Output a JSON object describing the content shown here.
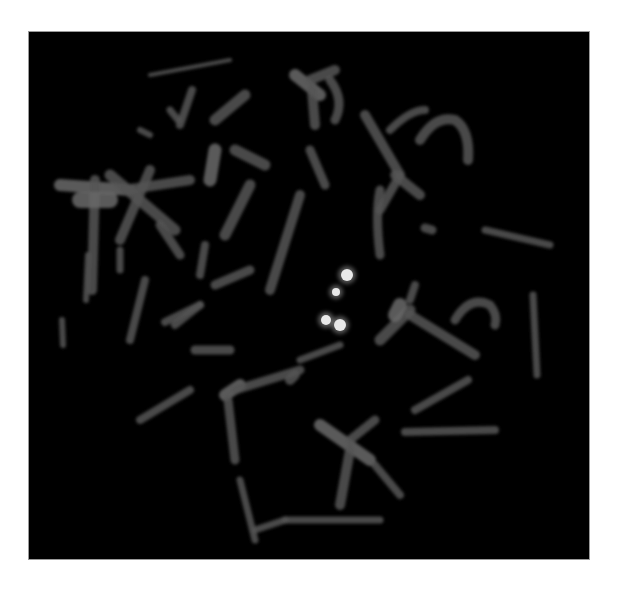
{
  "figure": {
    "kind": "fluorescence-micrograph",
    "background_color": "#000000",
    "page_color": "#ffffff",
    "panel": {
      "x": 29,
      "y": 32,
      "width": 560,
      "height": 527
    },
    "colors": {
      "chromosome": "#555555",
      "chromosome_bright": "#6a6a6a",
      "signal": "#e8e8e8",
      "signal_glow": "#bdbdbd"
    }
  },
  "chromosomes": [
    {
      "d": "M 60 185 L 130 190",
      "w": 12
    },
    {
      "d": "M 95 180 L 92 290",
      "w": 10
    },
    {
      "d": "M 80 200 L 110 200",
      "w": 16
    },
    {
      "d": "M 110 175 L 175 230",
      "w": 11
    },
    {
      "d": "M 150 170 L 120 240",
      "w": 10
    },
    {
      "d": "M 125 190 L 190 180",
      "w": 10
    },
    {
      "d": "M 160 225 L 180 255",
      "w": 9
    },
    {
      "d": "M 192 90 L 180 125",
      "w": 8
    },
    {
      "d": "M 245 95 L 215 120",
      "w": 11
    },
    {
      "d": "M 215 150 L 210 180",
      "w": 13
    },
    {
      "d": "M 235 150 L 265 165",
      "w": 11
    },
    {
      "d": "M 250 185 L 225 235",
      "w": 11
    },
    {
      "d": "M 300 195 L 270 290",
      "w": 10
    },
    {
      "d": "M 200 275 L 205 245",
      "w": 8
    },
    {
      "d": "M 250 270 L 215 285",
      "w": 9
    },
    {
      "d": "M 200 305 L 175 325",
      "w": 8
    },
    {
      "d": "M 145 280 L 130 340",
      "w": 8
    },
    {
      "d": "M 120 250 L 120 270",
      "w": 7
    },
    {
      "d": "M 88 255 L 86 300",
      "w": 6
    },
    {
      "d": "M 62 320 L 63 345",
      "w": 6
    },
    {
      "d": "M 195 350 L 230 350",
      "w": 9
    },
    {
      "d": "M 295 75 L 320 95",
      "w": 12
    },
    {
      "d": "M 310 80 L 335 70",
      "w": 10
    },
    {
      "d": "M 312 90 L 315 125",
      "w": 10
    },
    {
      "d": "M 330 80 Q 345 100 335 120",
      "w": 9
    },
    {
      "d": "M 310 150 L 325 185",
      "w": 9
    },
    {
      "d": "M 365 115 L 400 175",
      "w": 10
    },
    {
      "d": "M 395 175 L 420 195",
      "w": 10
    },
    {
      "d": "M 400 175 L 380 210",
      "w": 9
    },
    {
      "d": "M 390 130 Q 410 110 425 110",
      "w": 8
    },
    {
      "d": "M 380 190 Q 375 215 380 255",
      "w": 9
    },
    {
      "d": "M 420 140 Q 435 115 455 120 Q 470 130 468 160",
      "w": 10
    },
    {
      "d": "M 425 228 L 432 230",
      "w": 9
    },
    {
      "d": "M 485 230 L 550 245",
      "w": 7
    },
    {
      "d": "M 410 310 L 380 340",
      "w": 11
    },
    {
      "d": "M 400 305 L 395 315",
      "w": 14
    },
    {
      "d": "M 410 300 L 415 285",
      "w": 8
    },
    {
      "d": "M 410 315 L 475 355",
      "w": 10
    },
    {
      "d": "M 455 320 Q 470 295 490 305 Q 498 315 495 325",
      "w": 9
    },
    {
      "d": "M 533 295 L 537 375",
      "w": 7
    },
    {
      "d": "M 468 380 L 415 410",
      "w": 8
    },
    {
      "d": "M 405 432 L 495 430",
      "w": 8
    },
    {
      "d": "M 320 425 L 370 460",
      "w": 12
    },
    {
      "d": "M 350 440 L 375 420",
      "w": 9
    },
    {
      "d": "M 350 450 L 340 505",
      "w": 10
    },
    {
      "d": "M 375 465 L 400 495",
      "w": 8
    },
    {
      "d": "M 225 395 L 240 385",
      "w": 12
    },
    {
      "d": "M 235 390 L 300 370",
      "w": 9
    },
    {
      "d": "M 228 400 L 235 460",
      "w": 9
    },
    {
      "d": "M 240 480 L 255 540",
      "w": 7
    },
    {
      "d": "M 255 530 L 285 520",
      "w": 7
    },
    {
      "d": "M 285 520 L 380 520",
      "w": 7
    },
    {
      "d": "M 140 420 L 190 390",
      "w": 8
    },
    {
      "d": "M 165 322 L 200 305",
      "w": 8
    },
    {
      "d": "M 300 360 L 340 345",
      "w": 7
    },
    {
      "d": "M 290 380 L 295 375",
      "w": 10
    },
    {
      "d": "M 150 75 L 230 60",
      "w": 4
    },
    {
      "d": "M 170 110 L 178 120",
      "w": 7
    },
    {
      "d": "M 140 130 L 150 135",
      "w": 6
    }
  ],
  "signals": [
    {
      "cx": 347,
      "cy": 275,
      "r": 6
    },
    {
      "cx": 340,
      "cy": 325,
      "r": 6
    },
    {
      "cx": 326,
      "cy": 320,
      "r": 5
    },
    {
      "cx": 336,
      "cy": 292,
      "r": 4
    }
  ]
}
